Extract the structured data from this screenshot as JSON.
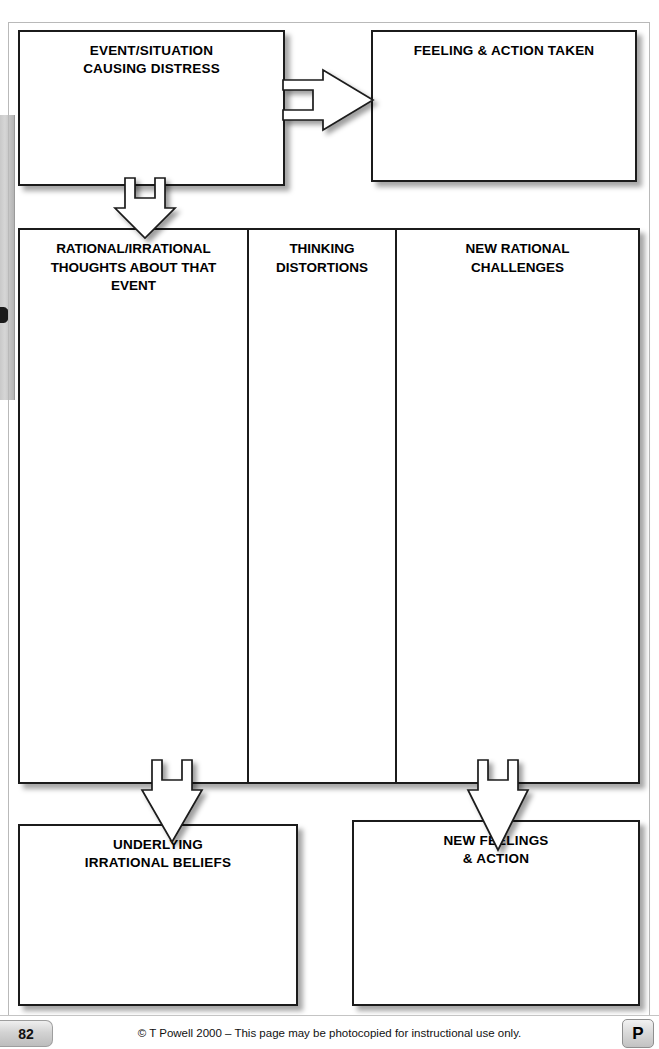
{
  "worksheet": {
    "boxes": {
      "event": {
        "title": "EVENT/SITUATION\nCAUSING DISTRESS"
      },
      "feeling": {
        "title": "FEELING & ACTION TAKEN"
      },
      "beliefs": {
        "title": "UNDERLYING\nIRRATIONAL BELIEFS"
      },
      "new_feelings": {
        "title": "NEW FEELINGS\n& ACTION"
      }
    },
    "table": {
      "columns": [
        {
          "header": "RATIONAL/IRRATIONAL\nTHOUGHTS ABOUT THAT\nEVENT",
          "value": ""
        },
        {
          "header": "THINKING\nDISTORTIONS",
          "value": ""
        },
        {
          "header": "NEW RATIONAL\nCHALLENGES",
          "value": ""
        }
      ]
    },
    "arrows": [
      {
        "name": "event-to-feeling",
        "direction": "right"
      },
      {
        "name": "event-to-table",
        "direction": "down"
      },
      {
        "name": "table-to-beliefs",
        "direction": "down"
      },
      {
        "name": "table-to-new-feelings",
        "direction": "down"
      }
    ]
  },
  "footer": {
    "page_number": "82",
    "copyright": "© T Powell 2000 – This page may be photocopied for instructional use only.",
    "publisher_mark": "P"
  },
  "colors": {
    "ink": "#1b1b1b",
    "page": "#ffffff",
    "frame": "#b9b9b9",
    "badge_gray": "#d3d3d3"
  }
}
